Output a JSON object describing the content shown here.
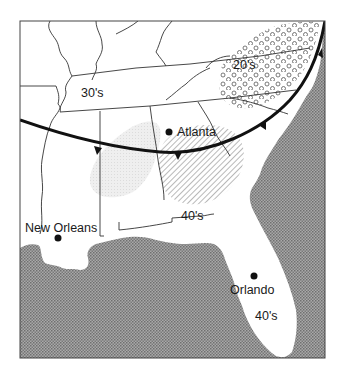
{
  "map": {
    "title": "Southeastern United States weather map",
    "colors": {
      "land": "#ffffff",
      "water_pattern_dark": "#6e6e6e",
      "water_pattern_light": "#b8b8b8",
      "front_line": "#111111",
      "state_border": "#333333",
      "dot_region": "#555555",
      "hatch_region": "#777777",
      "stipple_region": "#d8d8d8"
    },
    "cities": [
      {
        "name": "Atlanta",
        "x": 171,
        "y": 132
      },
      {
        "name": "New Orleans",
        "x": 58,
        "y": 238
      },
      {
        "name": "Orlando",
        "x": 254,
        "y": 275
      }
    ],
    "temperature_labels": [
      {
        "text": "30's",
        "x": 81,
        "y": 97
      },
      {
        "text": "20's",
        "x": 230,
        "y": 70
      },
      {
        "text": "40's",
        "x": 179,
        "y": 220
      },
      {
        "text": "40's",
        "x": 255,
        "y": 320
      }
    ],
    "legend_regions": [
      {
        "name": "cold-region-20s",
        "pattern": "open circles"
      },
      {
        "name": "warm-region-40s-hatched",
        "pattern": "diagonal hatching"
      },
      {
        "name": "stippled-region",
        "pattern": "light stipple"
      }
    ],
    "front": {
      "type": "cold front",
      "symbol": "triangles"
    }
  }
}
